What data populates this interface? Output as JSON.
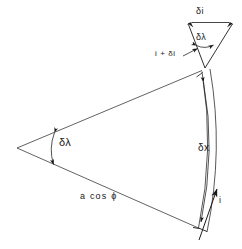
{
  "figure": {
    "stroke_color": "#1a1a1a",
    "background_color": "#ffffff"
  },
  "labels": {
    "delta_x": "δx",
    "delta_lambda_main": "δλ",
    "a_cos_phi": "a  cos ϕ",
    "i_tangent": "i",
    "delta_i": "δi",
    "delta_lambda_small": "δλ",
    "i_plus_delta_i": "i + δi"
  },
  "geometry": {
    "apex": {
      "x": 17,
      "y": 148
    },
    "top_edge_end": {
      "x": 202,
      "y": 70
    },
    "bottom_edge_end": {
      "x": 198,
      "y": 228
    },
    "inner_arc": {
      "start": {
        "x": 202,
        "y": 70
      },
      "end": {
        "x": 198,
        "y": 228
      },
      "bulge": 14
    },
    "outer_arc": {
      "start": {
        "x": 210,
        "y": 69
      },
      "end": {
        "x": 207,
        "y": 231
      },
      "bulge": 15
    },
    "small_triangle": {
      "apex": {
        "x": 205,
        "y": 68
      },
      "top_left": {
        "x": 188,
        "y": 23
      },
      "top_right": {
        "x": 232,
        "y": 23
      }
    },
    "angle_arc_main": {
      "center": {
        "x": 17,
        "y": 148
      },
      "radius": 38
    },
    "angle_arc_small": {
      "center": {
        "x": 205,
        "y": 68
      },
      "radius": 28
    },
    "tangent_arrow": {
      "from": {
        "x": 199,
        "y": 240
      },
      "to": {
        "x": 218,
        "y": 187
      }
    }
  }
}
